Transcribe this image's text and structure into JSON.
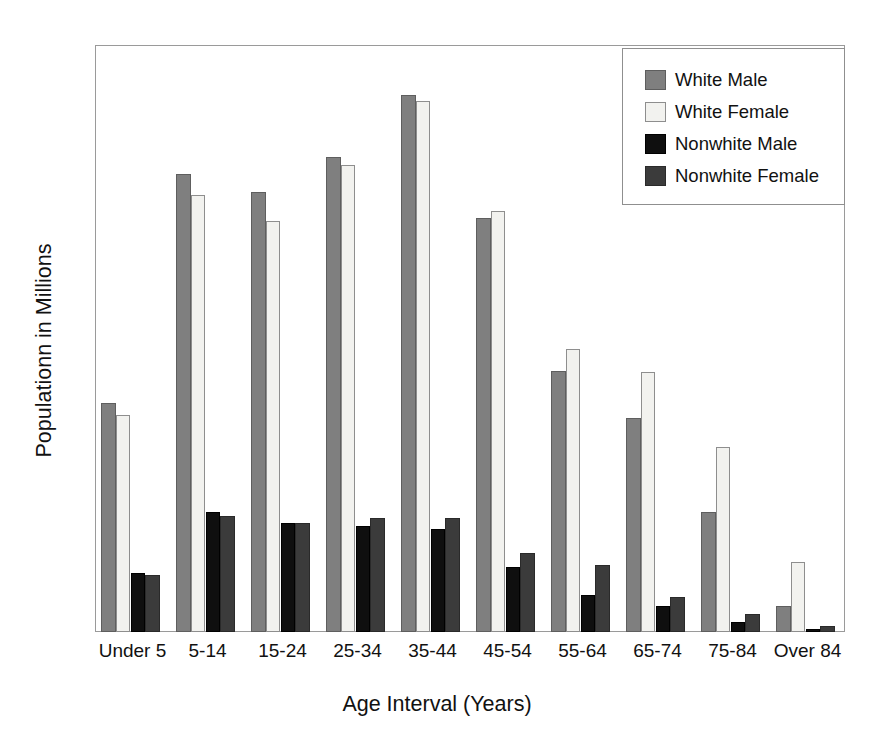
{
  "chart_data": {
    "type": "bar",
    "title": "",
    "xlabel": "Age Interval  (Years)",
    "ylabel": "Populationn in Millions",
    "ylim": [
      0,
      20
    ],
    "yticks": [
      0,
      5,
      10,
      15,
      20
    ],
    "ytick_labels": [
      "0",
      "5",
      "10",
      "15",
      "20"
    ],
    "grid": false,
    "legend_position": "top-right",
    "categories": [
      "Under 5",
      "5-14",
      "15-24",
      "25-34",
      "35-44",
      "45-54",
      "55-64",
      "65-74",
      "75-84",
      "Over 84"
    ],
    "series": [
      {
        "name": "White Male",
        "color": "#7f7f7f",
        "values": [
          7.8,
          15.6,
          15.0,
          16.2,
          18.3,
          14.1,
          8.9,
          7.3,
          4.1,
          0.9
        ]
      },
      {
        "name": "White Female",
        "color": "#f2f2ef",
        "values": [
          7.4,
          14.9,
          14.0,
          15.9,
          18.1,
          14.35,
          9.65,
          8.85,
          6.3,
          2.4
        ]
      },
      {
        "name": "Nonwhite Male",
        "color": "#0f0f0f",
        "values": [
          2.0,
          4.1,
          3.7,
          3.6,
          3.5,
          2.2,
          1.25,
          0.9,
          0.35,
          0.1
        ]
      },
      {
        "name": "Nonwhite Female",
        "color": "#3b3b3b",
        "values": [
          1.95,
          3.95,
          3.7,
          3.9,
          3.9,
          2.7,
          2.3,
          1.2,
          0.6,
          0.2
        ]
      }
    ]
  },
  "axes": {
    "y_title": "Populationn in Millions",
    "x_title": "Age Interval  (Years)"
  },
  "legend": {
    "entries": [
      {
        "label": "White Male"
      },
      {
        "label": "White Female"
      },
      {
        "label": "Nonwhite Male"
      },
      {
        "label": "Nonwhite Female"
      }
    ]
  }
}
